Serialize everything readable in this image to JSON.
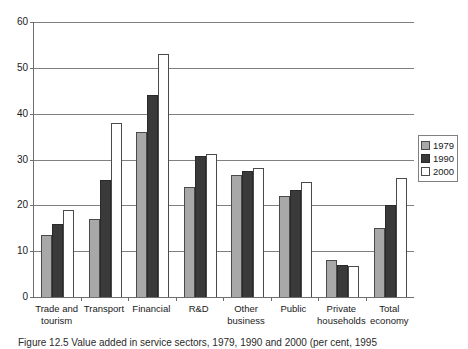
{
  "chart_data": {
    "type": "bar",
    "title": "",
    "xlabel": "",
    "ylabel": "",
    "ylim": [
      0,
      60
    ],
    "ytick_step": 10,
    "yticks": [
      0,
      10,
      20,
      30,
      40,
      50,
      60
    ],
    "grid": true,
    "legend_position": "right",
    "categories": [
      "Trade and tourism",
      "Transport",
      "Financial",
      "R&D",
      "Other business",
      "Public",
      "Private households",
      "Total economy"
    ],
    "category_lines": [
      [
        "Trade and",
        "tourism"
      ],
      [
        "Transport",
        ""
      ],
      [
        "Financial",
        ""
      ],
      [
        "R&D",
        ""
      ],
      [
        "Other",
        "business"
      ],
      [
        "Public",
        ""
      ],
      [
        "Private",
        "households"
      ],
      [
        "Total",
        "economy"
      ]
    ],
    "series": [
      {
        "name": "1979",
        "color": "#a8a8a8",
        "values": [
          13.5,
          17.0,
          36.0,
          24.0,
          26.7,
          22.0,
          8.0,
          15.0
        ]
      },
      {
        "name": "1990",
        "color": "#3a3a3a",
        "values": [
          16.0,
          25.5,
          44.0,
          30.7,
          27.4,
          23.3,
          7.0,
          20.0
        ]
      },
      {
        "name": "2000",
        "color": "#ffffff",
        "values": [
          19.0,
          38.0,
          53.0,
          31.2,
          28.2,
          25.0,
          6.8,
          26.0
        ]
      }
    ]
  },
  "legend": {
    "entries": [
      {
        "label": "1979",
        "swatch": "s1979"
      },
      {
        "label": "1990",
        "swatch": "s1990"
      },
      {
        "label": "2000",
        "swatch": "s2000"
      }
    ]
  },
  "caption": {
    "text": "Figure 12.5 Value added in service sectors, 1979, 1990 and 2000 (per cent, 1995"
  },
  "colors": {
    "series_1979": "#a8a8a8",
    "series_1990": "#3a3a3a",
    "series_2000": "#ffffff",
    "axis": "#6e6e6e",
    "gridline": "#808080",
    "text": "#1a1a1a",
    "background": "#ffffff"
  }
}
